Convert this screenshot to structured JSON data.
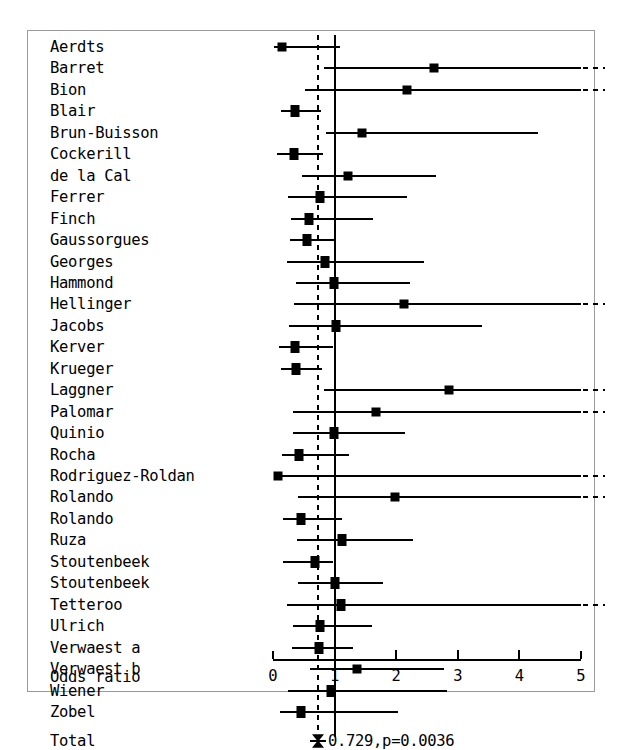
{
  "chart_data": {
    "type": "forest",
    "title": "",
    "xlabel": "Odds ratio",
    "ylabel": "",
    "xlim": [
      0,
      5
    ],
    "xticks": [
      0,
      1,
      2,
      3,
      4,
      5
    ],
    "xtick_labels": [
      "0",
      "1",
      "2",
      "3",
      "4",
      "5"
    ],
    "grid": false,
    "legend": "none",
    "null_value": 1,
    "pooled": {
      "label": "Total",
      "estimate": 0.729,
      "p_value": 0.0036,
      "annotation": "0.729,p=0.0036"
    },
    "categories": [
      "Aerdts",
      "Barret",
      "Bion",
      "Blair",
      "Brun-Buisson",
      "Cockerill",
      "de la Cal",
      "Ferrer",
      "Finch",
      "Gaussorgues",
      "Georges",
      "Hammond",
      "Hellinger",
      "Jacobs",
      "Kerver",
      "Krueger",
      "Laggner",
      "Palomar",
      "Quinio",
      "Rocha",
      "Rodriguez-Roldan",
      "Rolando",
      "Rolando",
      "Ruza",
      "Stoutenbeek",
      "Stoutenbeek",
      "Tetteroo",
      "Ulrich",
      "Verwaest a",
      "Verwaest b",
      "Wiener",
      "Zobel"
    ],
    "studies": [
      {
        "label": "Aerdts",
        "or": 0.15,
        "lo": 0.02,
        "hi": 1.08,
        "truncated": false
      },
      {
        "label": "Barret",
        "or": 2.62,
        "lo": 0.82,
        "hi": 5.0,
        "truncated": true
      },
      {
        "label": "Bion",
        "or": 2.17,
        "lo": 0.52,
        "hi": 5.0,
        "truncated": true
      },
      {
        "label": "Blair",
        "or": 0.36,
        "lo": 0.13,
        "hi": 0.78,
        "truncated": false
      },
      {
        "label": "Brun-Buisson",
        "or": 1.44,
        "lo": 0.86,
        "hi": 4.3,
        "truncated": false
      },
      {
        "label": "Cockerill",
        "or": 0.34,
        "lo": 0.07,
        "hi": 0.82,
        "truncated": false
      },
      {
        "label": "de la Cal",
        "or": 1.22,
        "lo": 0.47,
        "hi": 2.64,
        "truncated": false
      },
      {
        "label": "Ferrer",
        "or": 0.77,
        "lo": 0.24,
        "hi": 2.17,
        "truncated": false
      },
      {
        "label": "Finch",
        "or": 0.58,
        "lo": 0.29,
        "hi": 1.62,
        "truncated": false
      },
      {
        "label": "Gaussorgues",
        "or": 0.55,
        "lo": 0.27,
        "hi": 1.02,
        "truncated": false
      },
      {
        "label": "Georges",
        "or": 0.85,
        "lo": 0.22,
        "hi": 2.45,
        "truncated": false
      },
      {
        "label": "Hammond",
        "or": 0.99,
        "lo": 0.37,
        "hi": 2.23,
        "truncated": false
      },
      {
        "label": "Hellinger",
        "or": 2.12,
        "lo": 0.34,
        "hi": 5.0,
        "truncated": true
      },
      {
        "label": "Jacobs",
        "or": 1.03,
        "lo": 0.26,
        "hi": 3.39,
        "truncated": false
      },
      {
        "label": "Kerver",
        "or": 0.36,
        "lo": 0.1,
        "hi": 0.98,
        "truncated": false
      },
      {
        "label": "Krueger",
        "or": 0.37,
        "lo": 0.13,
        "hi": 0.79,
        "truncated": false
      },
      {
        "label": "Laggner",
        "or": 2.85,
        "lo": 0.82,
        "hi": 5.0,
        "truncated": true
      },
      {
        "label": "Palomar",
        "or": 1.68,
        "lo": 0.33,
        "hi": 5.0,
        "truncated": true
      },
      {
        "label": "Quinio",
        "or": 0.99,
        "lo": 0.32,
        "hi": 2.15,
        "truncated": false
      },
      {
        "label": "Rocha",
        "or": 0.42,
        "lo": 0.15,
        "hi": 1.23,
        "truncated": false
      },
      {
        "label": "Rodriguez-Roldan",
        "or": 0.08,
        "lo": 0.01,
        "hi": 5.0,
        "truncated": true
      },
      {
        "label": "Rolando",
        "or": 1.98,
        "lo": 0.4,
        "hi": 5.0,
        "truncated": true
      },
      {
        "label": "Rolando",
        "or": 0.46,
        "lo": 0.17,
        "hi": 1.12,
        "truncated": false
      },
      {
        "label": "Ruza",
        "or": 1.12,
        "lo": 0.39,
        "hi": 2.27,
        "truncated": false
      },
      {
        "label": "Stoutenbeek",
        "or": 0.68,
        "lo": 0.17,
        "hi": 0.97,
        "truncated": false
      },
      {
        "label": "Stoutenbeek",
        "or": 1.01,
        "lo": 0.41,
        "hi": 1.78,
        "truncated": false
      },
      {
        "label": "Tetteroo",
        "or": 1.1,
        "lo": 0.23,
        "hi": 5.0,
        "truncated": true
      },
      {
        "label": "Ulrich",
        "or": 0.77,
        "lo": 0.32,
        "hi": 1.6,
        "truncated": false
      },
      {
        "label": "Verwaest a",
        "or": 0.74,
        "lo": 0.31,
        "hi": 1.3,
        "truncated": false
      },
      {
        "label": "Verwaest b",
        "or": 1.36,
        "lo": 0.6,
        "hi": 2.78,
        "truncated": false
      },
      {
        "label": "Wiener",
        "or": 0.94,
        "lo": 0.25,
        "hi": 2.82,
        "truncated": false
      },
      {
        "label": "Zobel",
        "or": 0.45,
        "lo": 0.12,
        "hi": 2.03,
        "truncated": false
      }
    ]
  }
}
